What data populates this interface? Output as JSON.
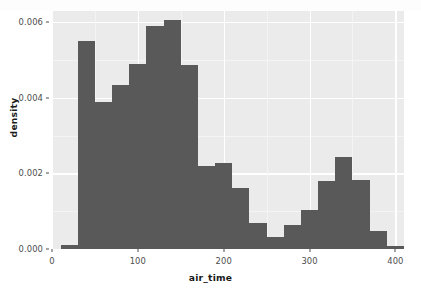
{
  "chart_data": {
    "type": "bar",
    "title": "",
    "subtitle": "",
    "xlabel": "air_time",
    "ylabel": "density",
    "xlim": [
      0,
      410
    ],
    "ylim": [
      0.0,
      0.0063
    ],
    "grid": true,
    "legend": null,
    "binwidth": 20,
    "bar_color": "#595959",
    "panel_color": "#EBEBEB",
    "gridline_color": "#FFFFFF",
    "x_ticks": [
      {
        "value": 0,
        "label": "0"
      },
      {
        "value": 100,
        "label": "100"
      },
      {
        "value": 200,
        "label": "200"
      },
      {
        "value": 300,
        "label": "300"
      },
      {
        "value": 400,
        "label": "400"
      }
    ],
    "x_minor_ticks": [
      50,
      150,
      250,
      350
    ],
    "y_ticks": [
      {
        "value": 0.0,
        "label": "0.000"
      },
      {
        "value": 0.002,
        "label": "0.002"
      },
      {
        "value": 0.004,
        "label": "0.004"
      },
      {
        "value": 0.006,
        "label": "0.006"
      }
    ],
    "y_minor_ticks": [
      0.001,
      0.003,
      0.005
    ],
    "bins": [
      {
        "x0": 10,
        "x1": 30,
        "center": 20,
        "density": 0.0001
      },
      {
        "x0": 30,
        "x1": 50,
        "center": 40,
        "density": 0.0055
      },
      {
        "x0": 50,
        "x1": 70,
        "center": 60,
        "density": 0.0039
      },
      {
        "x0": 70,
        "x1": 90,
        "center": 80,
        "density": 0.00435
      },
      {
        "x0": 90,
        "x1": 110,
        "center": 100,
        "density": 0.0049
      },
      {
        "x0": 110,
        "x1": 130,
        "center": 120,
        "density": 0.0059
      },
      {
        "x0": 130,
        "x1": 150,
        "center": 140,
        "density": 0.00605
      },
      {
        "x0": 150,
        "x1": 170,
        "center": 160,
        "density": 0.00487
      },
      {
        "x0": 170,
        "x1": 190,
        "center": 180,
        "density": 0.0022
      },
      {
        "x0": 190,
        "x1": 210,
        "center": 200,
        "density": 0.00227
      },
      {
        "x0": 210,
        "x1": 230,
        "center": 220,
        "density": 0.00162
      },
      {
        "x0": 230,
        "x1": 250,
        "center": 240,
        "density": 0.0007
      },
      {
        "x0": 250,
        "x1": 270,
        "center": 260,
        "density": 0.00031
      },
      {
        "x0": 270,
        "x1": 290,
        "center": 280,
        "density": 0.00063
      },
      {
        "x0": 290,
        "x1": 310,
        "center": 300,
        "density": 0.00103
      },
      {
        "x0": 310,
        "x1": 330,
        "center": 320,
        "density": 0.0018
      },
      {
        "x0": 330,
        "x1": 350,
        "center": 340,
        "density": 0.00243
      },
      {
        "x0": 350,
        "x1": 370,
        "center": 360,
        "density": 0.00182
      },
      {
        "x0": 370,
        "x1": 390,
        "center": 380,
        "density": 0.00048
      },
      {
        "x0": 390,
        "x1": 410,
        "center": 400,
        "density": 8e-05
      }
    ]
  }
}
